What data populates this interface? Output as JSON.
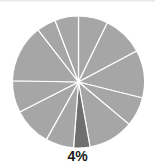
{
  "chart_data": {
    "type": "pie",
    "title": "",
    "start_angle_deg": 0,
    "direction": "clockwise",
    "slices": [
      {
        "value": 7.2,
        "highlight": false
      },
      {
        "value": 10.0,
        "highlight": false
      },
      {
        "value": 11.7,
        "highlight": false
      },
      {
        "value": 7.2,
        "highlight": false
      },
      {
        "value": 11.1,
        "highlight": false
      },
      {
        "value": 4.0,
        "highlight": true,
        "label": "4%"
      },
      {
        "value": 6.9,
        "highlight": false
      },
      {
        "value": 9.4,
        "highlight": false
      },
      {
        "value": 7.8,
        "highlight": false
      },
      {
        "value": 14.2,
        "highlight": false
      },
      {
        "value": 4.7,
        "highlight": false
      },
      {
        "value": 5.8,
        "highlight": false
      }
    ],
    "annotations": [
      "4%"
    ],
    "legend": null
  },
  "colors": {
    "slice": "#a6a6a6",
    "highlight": "#6f6f6f",
    "separator": "#ffffff"
  },
  "highlight_label": "4%"
}
